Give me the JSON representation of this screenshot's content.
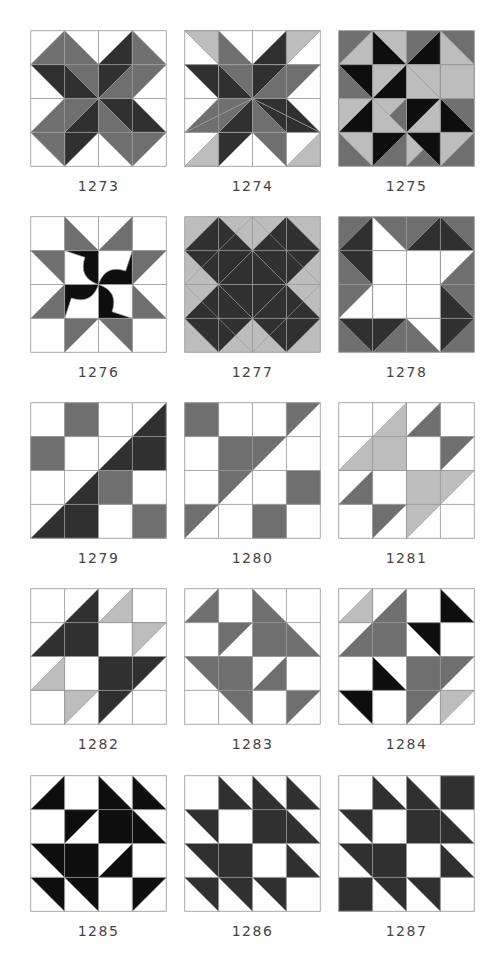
{
  "colors": {
    "white": "#ffffff",
    "light": "#bdbdbd",
    "mid": "#6f6f6f",
    "dark": "#303030",
    "black": "#0e0e0e",
    "grid": "#9a9a9a"
  },
  "blocks": [
    {
      "id": "1273",
      "label": "1273",
      "col": 0,
      "row": 0,
      "bg": "white",
      "shapes": [
        [
          "mid",
          "0,1 1,0 1,1"
        ],
        [
          "mid",
          "1,0 2,1 2,2 1,1"
        ],
        [
          "dark",
          "0,1 1,1 2,2 1,2"
        ],
        [
          "dark",
          "3,0 2,1 2,2 3,1"
        ],
        [
          "mid",
          "3,0 4,1 3,1"
        ],
        [
          "mid",
          "2,2 3,1 4,1 3,2"
        ],
        [
          "dark",
          "2,2 3,2 4,3 3,3"
        ],
        [
          "mid",
          "4,3 3,4 3,3"
        ],
        [
          "mid",
          "2,2 3,3 3,4 2,3"
        ],
        [
          "dark",
          "2,2 2,3 1,4 1,3"
        ],
        [
          "mid",
          "1,4 0,3 1,3"
        ],
        [
          "mid",
          "2,2 1,3 0,3 1,2"
        ]
      ]
    },
    {
      "id": "1274",
      "label": "1274",
      "col": 1,
      "row": 0,
      "bg": "white",
      "shapes": [
        [
          "light",
          "0,0 1,0 1,1"
        ],
        [
          "mid",
          "1,0 2,1 1,1"
        ],
        [
          "mid",
          "1,1 2,1 2,2"
        ],
        [
          "dark",
          "0,1 1,1 2,2"
        ],
        [
          "dark",
          "0,1 1,1 1,2 0,1"
        ],
        [
          "dark",
          "1,1 2,2 1,2"
        ],
        [
          "light",
          "3,0 4,0 3,1"
        ],
        [
          "dark",
          "3,0 3,1 2,1"
        ],
        [
          "dark",
          "2,1 3,1 2,2"
        ],
        [
          "mid",
          "3,1 4,1 2,2"
        ],
        [
          "mid",
          "3,1 4,1 3,2 2,2"
        ],
        [
          "light",
          "4,3 4,4 3,4"
        ],
        [
          "mid",
          "3,3 3,4 2,3"
        ],
        [
          "mid",
          "2,2 3,3 2,3"
        ],
        [
          "dark",
          "2,2 4,3 3,3"
        ],
        [
          "dark",
          "2,2 3,2 4,3"
        ],
        [
          "light",
          "0,4 1,3 1,4"
        ],
        [
          "dark",
          "1,3 2,3 1,4"
        ],
        [
          "dark",
          "1,3 2,2 2,3"
        ],
        [
          "mid",
          "0,3 2,2 1,3"
        ],
        [
          "mid",
          "1,2 2,2 0,3"
        ]
      ]
    },
    {
      "id": "1275",
      "label": "1275",
      "col": 2,
      "row": 0,
      "bg": "mid",
      "shapes": [
        [
          "light",
          "0,1 1,0 1,1"
        ],
        [
          "black",
          "1,0 2,1 1,1"
        ],
        [
          "light",
          "1,0 2,0 2,1"
        ],
        [
          "black",
          "3,0 2,1 3,1"
        ],
        [
          "light",
          "3,0 4,1 3,1"
        ],
        [
          "black",
          "0,1 1,1 1,2"
        ],
        [
          "light",
          "1,1 2,1 1,2"
        ],
        [
          "light",
          "2,1 3,1 3,2"
        ],
        [
          "black",
          "3,1 4,1 3,2"
        ],
        [
          "light",
          "3,1 4,1 4,2 3,2"
        ],
        [
          "black",
          "1,2 2,1 2,2"
        ],
        [
          "light",
          "2,1 3,2 2,2"
        ],
        [
          "light",
          "0,2 1,2 0,3"
        ],
        [
          "black",
          "1,2 1,3 0,3"
        ],
        [
          "light",
          "1,2 2,2 1,3"
        ],
        [
          "black",
          "2,2 3,2 2,3"
        ],
        [
          "light",
          "2,3 3,2 3,3"
        ],
        [
          "black",
          "3,2 4,3 3,3"
        ],
        [
          "light",
          "0,3 1,3 1,4"
        ],
        [
          "black",
          "1,3 2,3 1,4"
        ],
        [
          "light",
          "2,3 3,3 2,4"
        ],
        [
          "black",
          "2,3 3,3 3,4"
        ],
        [
          "light",
          "3,3 4,3 3,4"
        ],
        [
          "light",
          "1,2 2,3 1,3"
        ]
      ]
    },
    {
      "id": "1276",
      "label": "1276",
      "col": 0,
      "row": 1,
      "bg": "white",
      "shapes": [
        [
          "mid",
          "1,0 2,1 1,1"
        ],
        [
          "mid",
          "3,0 3,1 2,1"
        ],
        [
          "mid",
          "0,1 1,1 1,2"
        ],
        [
          "mid",
          "3,1 4,1 3,2"
        ],
        [
          "mid",
          "1,2 1,3 0,3"
        ],
        [
          "mid",
          "3,2 4,3 3,3"
        ],
        [
          "mid",
          "1,3 2,3 1,4"
        ],
        [
          "mid",
          "2,3 3,3 3,4"
        ],
        [
          "black",
          "1,1 2,1 2,2 Q1.4,1.8 1.6,1.2 Z"
        ],
        [
          "black",
          "3,1 3,2 2,2 Q2.2,1.4 2.8,1.6 Z"
        ],
        [
          "black",
          "3,3 2,3 2,2 Q2.6,2.2 2.4,2.8 Z"
        ],
        [
          "black",
          "1,3 1,2 2,2 Q1.8,2.6 1.2,2.4 Z"
        ]
      ]
    },
    {
      "id": "1277",
      "label": "1277",
      "col": 1,
      "row": 1,
      "bg": "light",
      "shapes": [
        [
          "mid",
          "1,1 2,1 2,2 1,2"
        ],
        [
          "mid",
          "2,1 3,1 3,2 2,2"
        ],
        [
          "mid",
          "1,2 2,2 2,3 1,3"
        ],
        [
          "mid",
          "2,2 3,2 3,3 2,3"
        ],
        [
          "mid",
          "0.5,1.5 1,1 1,2"
        ],
        [
          "mid",
          "3.5,1.5 3,2 3,1"
        ],
        [
          "mid",
          "0.5,2.5 1,2 1,3"
        ],
        [
          "mid",
          "3.5,2.5 3,3 3,2"
        ],
        [
          "mid",
          "1.5,0.5 1,1 2,1"
        ],
        [
          "mid",
          "2.5,0.5 3,1 2,1"
        ],
        [
          "mid",
          "1.5,3.5 1,3 2,3"
        ],
        [
          "mid",
          "2.5,3.5 3,3 2,3"
        ],
        [
          "dark",
          "1,0 2,1 1,2 0,1"
        ],
        [
          "dark",
          "3,0 4,1 3,2 2,1"
        ],
        [
          "dark",
          "1,2 2,3 1,4 0,3"
        ],
        [
          "dark",
          "3,2 4,3 3,4 2,3"
        ],
        [
          "dark",
          "2,1 3,2 2,3 1,2"
        ],
        [
          "none",
          "2,0 4,2 2,4 0,2"
        ]
      ]
    },
    {
      "id": "1278",
      "label": "1278",
      "col": 2,
      "row": 1,
      "bg": "mid",
      "shapes": [
        [
          "dark",
          "1,0 1,2 0,1"
        ],
        [
          "white",
          "1,0 2,1 1,1"
        ],
        [
          "dark",
          "2,1 3,0 4,1"
        ],
        [
          "white",
          "4,1 3,2 3,1"
        ],
        [
          "dark",
          "3,2 4,3 3,4"
        ],
        [
          "white",
          "3,4 2,3 3,3"
        ],
        [
          "dark",
          "2,3 1,4 0,3"
        ],
        [
          "white",
          "0,3 1,2 1,3"
        ],
        [
          "white",
          "1,1 3,1 3,3 1,3"
        ]
      ]
    },
    {
      "id": "1279",
      "label": "1279",
      "col": 0,
      "row": 2,
      "bg": "white",
      "shapes": [
        [
          "mid",
          "1,0 2,0 2,1 1,1"
        ],
        [
          "mid",
          "0,1 1,1 1,2 0,2"
        ],
        [
          "mid",
          "2,2 3,2 3,3 2,3"
        ],
        [
          "mid",
          "3,3 4,3 4,4 3,4"
        ],
        [
          "dark",
          "4,0 4,2 2,2"
        ],
        [
          "dark",
          "2,2 2,4 0,4"
        ]
      ]
    },
    {
      "id": "1280",
      "label": "1280",
      "col": 1,
      "row": 2,
      "bg": "white",
      "shapes": [
        [
          "mid",
          "0,0 1,0 1,1 0,1"
        ],
        [
          "mid",
          "3,0 4,0 3,1"
        ],
        [
          "mid",
          "1,1 3,1 1,3"
        ],
        [
          "mid",
          "3,2 4,2 4,3 3,3"
        ],
        [
          "mid",
          "2,3 3,3 3,4 2,4"
        ],
        [
          "mid",
          "0,3 1,3 0,4"
        ]
      ]
    },
    {
      "id": "1281",
      "label": "1281",
      "col": 2,
      "row": 2,
      "bg": "white",
      "shapes": [
        [
          "light",
          "2,0 2,2 0,2"
        ],
        [
          "mid",
          "3,0 3,1 2,1"
        ],
        [
          "mid",
          "3,1 4,1 3,2"
        ],
        [
          "mid",
          "1,2 1,3 0,3"
        ],
        [
          "mid",
          "1,3 2,3 1,4"
        ],
        [
          "light",
          "2,2 4,2 2,4"
        ]
      ]
    },
    {
      "id": "1282",
      "label": "1282",
      "col": 0,
      "row": 3,
      "bg": "white",
      "shapes": [
        [
          "dark",
          "2,0 2,2 0,2"
        ],
        [
          "light",
          "3,0 3,1 2,1"
        ],
        [
          "light",
          "3,1 4,1 3,2"
        ],
        [
          "light",
          "1,2 1,3 0,3"
        ],
        [
          "light",
          "1,3 2,3 1,4"
        ],
        [
          "dark",
          "2,2 4,2 2,4"
        ]
      ]
    },
    {
      "id": "1283",
      "label": "1283",
      "col": 1,
      "row": 3,
      "bg": "white",
      "shapes": [
        [
          "mid",
          "1,0 1,1 0,1"
        ],
        [
          "mid",
          "1,1 2,1 1,2"
        ],
        [
          "mid",
          "2,0 4,2 2,2"
        ],
        [
          "mid",
          "0,2 2,2 2,4"
        ],
        [
          "mid",
          "3,2 3,3 2,3"
        ],
        [
          "mid",
          "3,3 4,3 3,4"
        ]
      ]
    },
    {
      "id": "1284",
      "label": "1284",
      "col": 2,
      "row": 3,
      "bg": "white",
      "shapes": [
        [
          "light",
          "1,0 1,1 0,1"
        ],
        [
          "mid",
          "2,0 2,2 0,2"
        ],
        [
          "black",
          "3,0 4,1 3,1"
        ],
        [
          "black",
          "2,1 3,1 3,2"
        ],
        [
          "black",
          "1,2 2,3 1,3"
        ],
        [
          "black",
          "0,3 1,3 1,4"
        ],
        [
          "mid",
          "2,2 4,2 2,4"
        ],
        [
          "light",
          "3,3 4,3 3,4"
        ]
      ]
    },
    {
      "id": "1285",
      "label": "1285",
      "col": 0,
      "row": 4,
      "bg": "white",
      "shapes": [
        [
          "black",
          "1,0 1,1 0,1"
        ],
        [
          "black",
          "1,1 2,1 1,2"
        ],
        [
          "black",
          "2,0 4,2 2,2"
        ],
        [
          "black",
          "3,0 4,1 3,1"
        ],
        [
          "black",
          "0,2 2,2 2,4"
        ],
        [
          "black",
          "3,2 3,3 2,3"
        ],
        [
          "black",
          "0,3 1,3 1,4"
        ],
        [
          "black",
          "3,3 4,3 3,4"
        ]
      ]
    },
    {
      "id": "1286",
      "label": "1286",
      "col": 1,
      "row": 4,
      "bg": "white",
      "shapes": [
        [
          "dark",
          "1,0 2,1 1,1"
        ],
        [
          "dark",
          "2,0 4,2 2,2"
        ],
        [
          "dark",
          "3,0 4,1 3,1"
        ],
        [
          "dark",
          "0,1 1,1 1,2"
        ],
        [
          "dark",
          "0,2 2,2 2,4"
        ],
        [
          "dark",
          "3,2 4,3 3,3"
        ],
        [
          "dark",
          "0,3 1,3 1,4"
        ],
        [
          "dark",
          "2,3 3,3 3,4"
        ]
      ]
    },
    {
      "id": "1287",
      "label": "1287",
      "col": 2,
      "row": 4,
      "bg": "white",
      "shapes": [
        [
          "dark",
          "1,0 2,1 1,1"
        ],
        [
          "dark",
          "2,0 4,2 2,2"
        ],
        [
          "dark",
          "3,0 4,0 4,1 3,1"
        ],
        [
          "dark",
          "0,1 1,1 1,2"
        ],
        [
          "dark",
          "0,2 2,2 2,4"
        ],
        [
          "dark",
          "3,2 4,3 3,3"
        ],
        [
          "dark",
          "0,3 1,3 1,4 0,4"
        ],
        [
          "dark",
          "2,3 3,3 3,4"
        ]
      ]
    }
  ],
  "layout": {
    "col_x": [
      30,
      184,
      338
    ],
    "row_y": [
      30,
      216,
      402,
      588,
      775
    ],
    "label_offset": 148
  }
}
